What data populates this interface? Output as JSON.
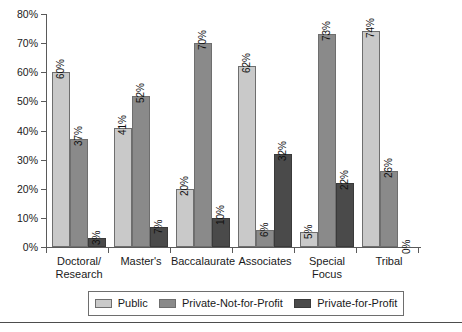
{
  "chart_data": {
    "type": "bar",
    "title": "",
    "subtitle": "",
    "xlabel": "",
    "ylabel": "",
    "ylim": [
      0,
      80
    ],
    "ytick_labels": [
      "0%",
      "10%",
      "20%",
      "30%",
      "40%",
      "50%",
      "60%",
      "70%",
      "80%"
    ],
    "ytick_values": [
      0,
      10,
      20,
      30,
      40,
      50,
      60,
      70,
      80
    ],
    "grid": false,
    "legend_position": "bottom",
    "categories": [
      "Doctoral/\nResearch",
      "Master's",
      "Baccalaurate",
      "Associates",
      "Special\nFocus",
      "Tribal"
    ],
    "series": [
      {
        "name": "Public",
        "color": "#c9c9c9",
        "values": [
          60,
          41,
          20,
          62,
          5,
          74
        ],
        "labels": [
          "60%",
          "41%",
          "20%",
          "62%",
          "5%",
          "74%"
        ]
      },
      {
        "name": "Private-Not-for-Profit",
        "color": "#8a8a8a",
        "values": [
          37,
          52,
          70,
          6,
          73,
          26
        ],
        "labels": [
          "37%",
          "52%",
          "70%",
          "6%",
          "73%",
          "26%"
        ]
      },
      {
        "name": "Private-for-Profit",
        "color": "#4a4a4a",
        "values": [
          3,
          7,
          10,
          32,
          22,
          0
        ],
        "labels": [
          "3%",
          "7%",
          "10%",
          "32%",
          "22%",
          "0%"
        ]
      }
    ]
  },
  "legend": {
    "items": [
      {
        "label": "Public",
        "swatch": "light-gray-swatch"
      },
      {
        "label": "Private-Not-for-Profit",
        "swatch": "medium-gray-swatch"
      },
      {
        "label": "Private-for-Profit",
        "swatch": "dark-gray-swatch"
      }
    ]
  },
  "axis": {
    "y_ticks": [
      "80%",
      "70%",
      "60%",
      "50%",
      "40%",
      "30%",
      "20%",
      "10%",
      "0%"
    ]
  },
  "colors": {
    "public": "#c9c9c9",
    "private_not_for_profit": "#8a8a8a",
    "private_for_profit": "#4a4a4a",
    "axis": "#5a5a5a",
    "text": "#1a1a1a",
    "background": "#ffffff"
  }
}
